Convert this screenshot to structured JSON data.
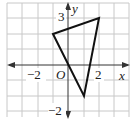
{
  "diagram": {
    "type": "coordinate-plane-triangle",
    "grid": {
      "x_min": -4,
      "x_max": 4,
      "y_min": -3,
      "y_max": 4,
      "step": 1
    },
    "axes": {
      "x_label": "x",
      "y_label": "y",
      "origin_label": "O"
    },
    "tick_labels": {
      "x_neg": "−2",
      "x_pos": "2",
      "y_pos": "3",
      "y_neg": "−2"
    },
    "triangle": {
      "vertices": [
        [
          -1,
          2
        ],
        [
          2,
          3
        ],
        [
          1,
          -2
        ]
      ],
      "stroke": "#111111"
    },
    "colors": {
      "grid": "#c8c8c8",
      "axis": "#333333",
      "background": "#ffffff"
    }
  }
}
